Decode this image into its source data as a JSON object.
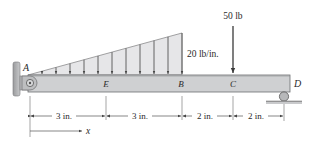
{
  "diagram": {
    "type": "beam-free-body",
    "points": {
      "A": "A",
      "E": "E",
      "B": "B",
      "C": "C",
      "D": "D"
    },
    "loads": {
      "distributed": {
        "label": "20 lb/in.",
        "shape": "triangular",
        "max_intensity": 20,
        "unit": "lb/in."
      },
      "point": {
        "label": "50 lb",
        "magnitude": 50,
        "unit": "lb"
      }
    },
    "supports": {
      "A": "pin-wall",
      "D": "roller"
    },
    "dimensions": [
      {
        "segment": "A-E",
        "label": "3 in."
      },
      {
        "segment": "E-B",
        "label": "3 in."
      },
      {
        "segment": "B-C",
        "label": "2 in."
      },
      {
        "segment": "C-D",
        "label": "2 in."
      }
    ],
    "axis": {
      "label": "x"
    },
    "colors": {
      "beam_fill": "#cfd0d2",
      "beam_stroke": "#6d6e70",
      "load_fill": "#e6e6e8",
      "line": "#3a3a3a"
    }
  }
}
